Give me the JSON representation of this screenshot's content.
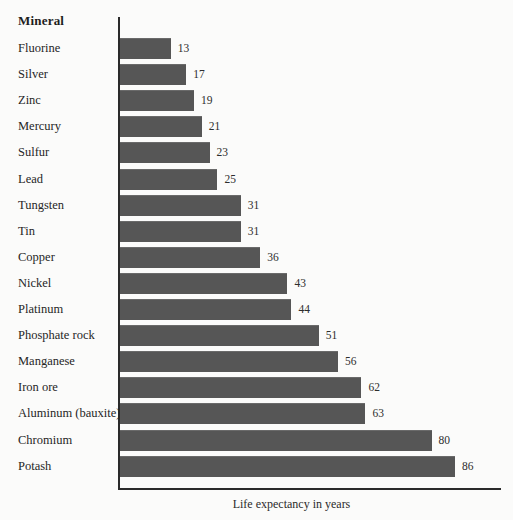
{
  "chart_data": {
    "type": "bar",
    "orientation": "horizontal",
    "title": "",
    "xlabel": "Life expectancy in years",
    "ylabel": "Mineral",
    "categories": [
      "Fluorine",
      "Silver",
      "Zinc",
      "Mercury",
      "Sulfur",
      "Lead",
      "Tungsten",
      "Tin",
      "Copper",
      "Nickel",
      "Platinum",
      "Phosphate rock",
      "Manganese",
      "Iron ore",
      "Aluminum (bauxite)",
      "Chromium",
      "Potash"
    ],
    "values": [
      13,
      17,
      19,
      21,
      23,
      25,
      31,
      31,
      36,
      43,
      44,
      51,
      56,
      62,
      63,
      80,
      86
    ],
    "value_labels": [
      "13",
      "17",
      "19",
      "21",
      "23",
      "25",
      "31",
      "31",
      "36",
      "43",
      "44",
      "51",
      "56",
      "62",
      "63",
      "80",
      "86"
    ],
    "xlim": [
      0,
      98
    ],
    "grid": false,
    "legend": null,
    "bar_color": "#565656",
    "axis_color": "#2a2a2a",
    "background_color": "#fbfbfa"
  },
  "header": {
    "category_column_label": "Mineral"
  },
  "axis": {
    "x_title": "Life expectancy in years"
  }
}
